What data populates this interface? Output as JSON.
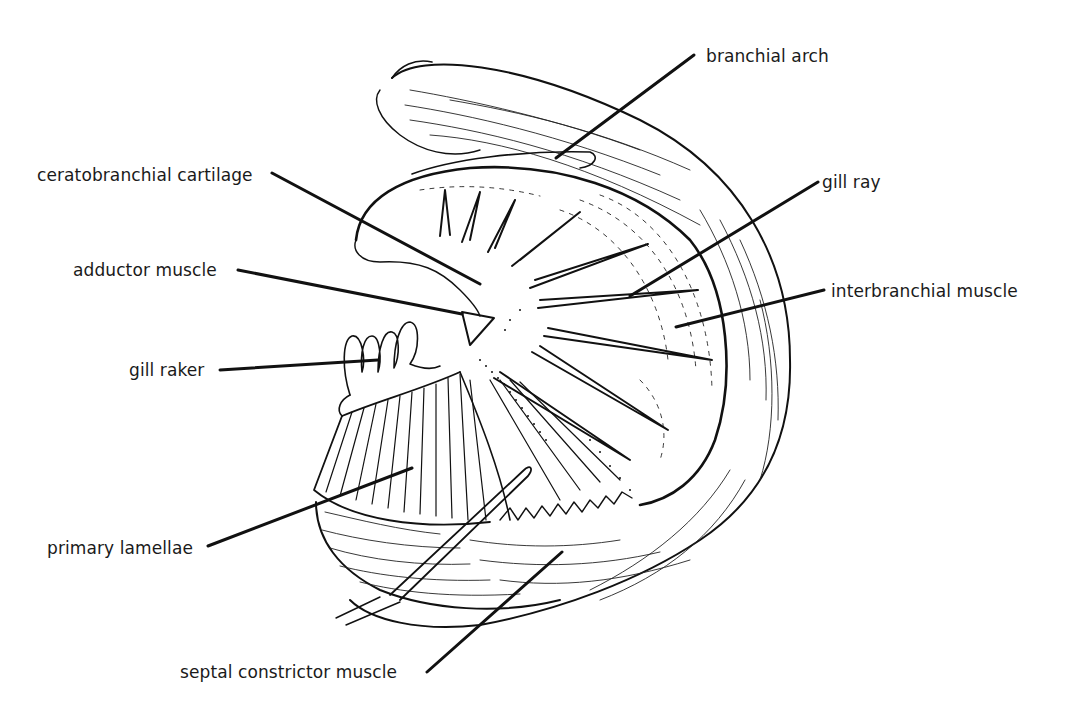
{
  "figure": {
    "labels": [
      {
        "id": "branchial-arch",
        "text": "branchial arch",
        "x": 706,
        "y": 46
      },
      {
        "id": "ceratobranchial-cartilage",
        "text": "ceratobranchial cartilage",
        "x": 37,
        "y": 165
      },
      {
        "id": "gill-ray",
        "text": "gill ray",
        "x": 822,
        "y": 172
      },
      {
        "id": "adductor-muscle",
        "text": "adductor muscle",
        "x": 73,
        "y": 260
      },
      {
        "id": "interbranchial-muscle",
        "text": "interbranchial  muscle",
        "x": 831,
        "y": 281
      },
      {
        "id": "gill-raker",
        "text": "gill raker",
        "x": 129,
        "y": 360
      },
      {
        "id": "primary-lamellae",
        "text": "primary lamellae",
        "x": 47,
        "y": 538
      },
      {
        "id": "septal-constrictor-muscle",
        "text": "septal constrictor muscle",
        "x": 180,
        "y": 662
      }
    ]
  }
}
